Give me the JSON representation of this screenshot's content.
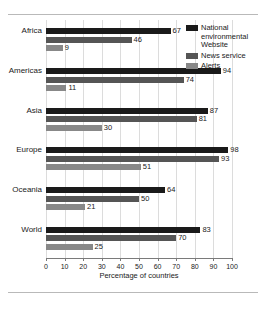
{
  "chart_data": {
    "type": "bar",
    "orientation": "horizontal",
    "title": "",
    "xlabel": "Percentage of countries",
    "ylabel": "",
    "xlim": [
      0,
      100
    ],
    "xticks": [
      0,
      10,
      20,
      30,
      40,
      50,
      60,
      70,
      80,
      90,
      100
    ],
    "grid": "vertical",
    "legend_position": "top-right",
    "categories": [
      "Africa",
      "Americas",
      "Asia",
      "Europe",
      "Oceania",
      "World"
    ],
    "series": [
      {
        "name": "National environmental Website",
        "color": "#1a1a1a",
        "values": [
          67,
          94,
          87,
          98,
          64,
          83
        ]
      },
      {
        "name": "News service",
        "color": "#555555",
        "values": [
          46,
          74,
          81,
          93,
          50,
          70
        ]
      },
      {
        "name": "Alerts",
        "color": "#888888",
        "values": [
          9,
          11,
          30,
          51,
          21,
          25
        ]
      }
    ]
  },
  "legend": {
    "items": [
      {
        "label": "National environmental Website",
        "color": "#1a1a1a"
      },
      {
        "label": "News service",
        "color": "#555555"
      },
      {
        "label": "Alerts",
        "color": "#888888"
      }
    ]
  },
  "axis": {
    "x_title": "Percentage of countries"
  }
}
